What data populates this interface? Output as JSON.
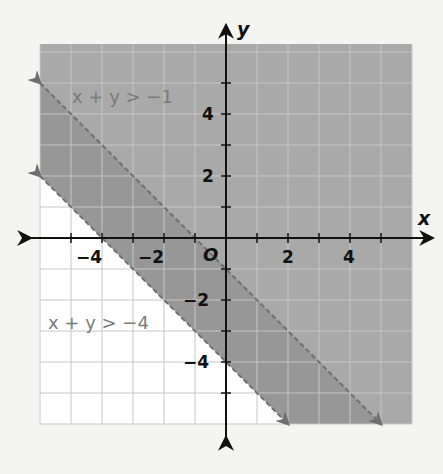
{
  "chart_data": {
    "type": "area",
    "title": "",
    "xlabel": "x",
    "ylabel": "y",
    "xlim": [
      -6,
      6
    ],
    "ylim": [
      -6,
      6.25
    ],
    "grid": true,
    "x_ticks": [
      -4,
      -2,
      2,
      4
    ],
    "y_ticks": [
      -4,
      -2,
      2,
      4
    ],
    "origin_label": "O",
    "series": [
      {
        "name": "x + y > -1",
        "boundary": "x + y = -1",
        "line_style": "dashed",
        "shaded": "above",
        "points": [
          [
            -6,
            5
          ],
          [
            5,
            -6
          ]
        ],
        "label_pos": [
          -5,
          5.3
        ]
      },
      {
        "name": "x + y > -4",
        "boundary": "x + y = -4",
        "line_style": "dashed",
        "shaded": "above",
        "points": [
          [
            -6,
            2
          ],
          [
            2,
            -6
          ]
        ],
        "label_pos": [
          -5.8,
          -2.8
        ]
      }
    ],
    "colors": {
      "shade_single": "#a9a9a9",
      "shade_overlap": "#9a9a9a",
      "boundary": "#6f6f6f",
      "grid_on_shade": "#bcbcbc",
      "grid_on_white": "#d0d0d0",
      "axis": "#111111"
    }
  },
  "labels": {
    "x_axis": "x",
    "y_axis": "y",
    "origin": "O",
    "tick_x_m4": "−4",
    "tick_x_m2": "−2",
    "tick_x_2": "2",
    "tick_x_4": "4",
    "tick_y_4": "4",
    "tick_y_2": "2",
    "tick_y_m2": "−2",
    "tick_y_m4": "−4",
    "ineq1": "x + y > −1",
    "ineq2": "x + y > −4"
  }
}
